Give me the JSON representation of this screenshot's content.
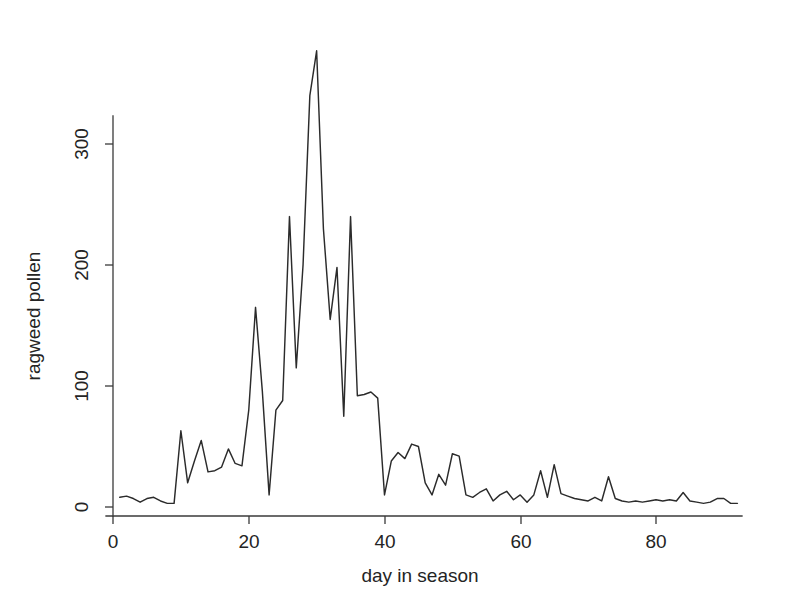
{
  "chart_data": {
    "type": "line",
    "title": "",
    "subtitle": "",
    "xlabel": "day in season",
    "ylabel": "ragweed pollen",
    "xlim": [
      0,
      93
    ],
    "ylim": [
      0,
      390
    ],
    "xticks": [
      0,
      20,
      40,
      60,
      80
    ],
    "xtick_labels": [
      "0",
      "20",
      "40",
      "60",
      "80"
    ],
    "yticks": [
      0,
      100,
      200,
      300
    ],
    "ytick_labels": [
      "0",
      "100",
      "200",
      "300"
    ],
    "grid": false,
    "legend": null,
    "legend_position": "none",
    "line_color": "#2b2b2b",
    "background_color": "#ffffff",
    "series": [
      {
        "name": "ragweed pollen",
        "x": [
          1,
          2,
          3,
          4,
          5,
          6,
          7,
          8,
          9,
          10,
          11,
          12,
          13,
          14,
          15,
          16,
          17,
          18,
          19,
          20,
          21,
          22,
          23,
          24,
          25,
          26,
          27,
          28,
          29,
          30,
          31,
          32,
          33,
          34,
          35,
          36,
          37,
          38,
          39,
          40,
          41,
          42,
          43,
          44,
          45,
          46,
          47,
          48,
          49,
          50,
          51,
          52,
          53,
          54,
          55,
          56,
          57,
          58,
          59,
          60,
          61,
          62,
          63,
          64,
          65,
          66,
          67,
          68,
          69,
          70,
          71,
          72,
          73,
          74,
          75,
          76,
          77,
          78,
          79,
          80,
          81,
          82,
          83,
          84,
          85,
          86,
          87,
          88,
          89,
          90,
          91,
          92
        ],
        "values": [
          8,
          9,
          7,
          4,
          7,
          8,
          5,
          3,
          3,
          63,
          20,
          38,
          55,
          29,
          30,
          33,
          48,
          36,
          34,
          80,
          165,
          96,
          10,
          80,
          88,
          240,
          115,
          200,
          340,
          377,
          230,
          155,
          198,
          75,
          240,
          92,
          93,
          95,
          90,
          10,
          38,
          45,
          40,
          52,
          50,
          20,
          10,
          27,
          18,
          44,
          42,
          10,
          8,
          12,
          15,
          5,
          10,
          13,
          6,
          10,
          4,
          10,
          30,
          8,
          35,
          11,
          9,
          7,
          6,
          5,
          8,
          5,
          25,
          7,
          5,
          4,
          5,
          4,
          5,
          6,
          5,
          6,
          5,
          12,
          5,
          4,
          3,
          4,
          7,
          7,
          3,
          3
        ]
      }
    ],
    "max_value": 377,
    "max_value_day": 30,
    "n_points": 92
  },
  "axes": {
    "y_axis_label": "ragweed pollen",
    "x_axis_label": "day in season",
    "y_tick_0": "0",
    "y_tick_100": "100",
    "y_tick_200": "200",
    "y_tick_300": "300",
    "x_tick_0": "0",
    "x_tick_20": "20",
    "x_tick_40": "40",
    "x_tick_60": "60",
    "x_tick_80": "80"
  }
}
